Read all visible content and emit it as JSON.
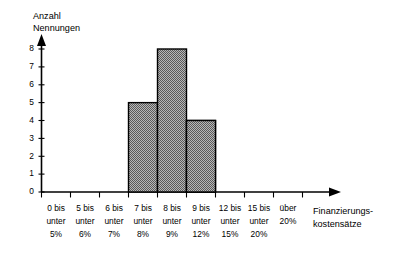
{
  "chart_data": {
    "type": "bar",
    "title": "",
    "subtitle": "",
    "ylabel_line1": "Anzahl",
    "ylabel_line2": "Nennungen",
    "xlabel_line1": "Finanzierungs-",
    "xlabel_line2": "kostensätze",
    "xlabel": "Finanzierungskostensätze",
    "ylabel": "Anzahl Nennungen",
    "categories": [
      "0 bis unter 5%",
      "5 bis unter 6%",
      "6 bis unter 7%",
      "7 bis unter 8%",
      "8 bis unter 9%",
      "9 bis unter 12%",
      "12 bis unter 15%",
      "15 bis unter 20%",
      "über 20%"
    ],
    "category_lines": [
      [
        "0 bis",
        "unter",
        "5%"
      ],
      [
        "5 bis",
        "unter",
        "6%"
      ],
      [
        "6 bis",
        "unter",
        "7%"
      ],
      [
        "7 bis",
        "unter",
        "8%"
      ],
      [
        "8 bis",
        "unter",
        "9%"
      ],
      [
        "9 bis",
        "unter",
        "12%"
      ],
      [
        "12 bis",
        "unter",
        "15%"
      ],
      [
        "15 bis",
        "unter",
        "20%"
      ],
      [
        "über",
        "20%",
        ""
      ]
    ],
    "values": [
      0,
      0,
      1,
      5,
      8,
      4,
      0,
      0,
      0
    ],
    "ylim": [
      0,
      8
    ],
    "yticks": [
      0,
      1,
      2,
      3,
      4,
      5,
      6,
      7,
      8
    ],
    "ytick_labels": [
      "0",
      "1",
      "2",
      "3",
      "4",
      "5",
      "6",
      "7",
      "8"
    ],
    "grid": false,
    "legend": false,
    "legend_position": "none",
    "bar_fill_color": "#808080",
    "bar_edge_color": "#000000",
    "axis_color": "#000000",
    "background_color": "#ffffff"
  }
}
